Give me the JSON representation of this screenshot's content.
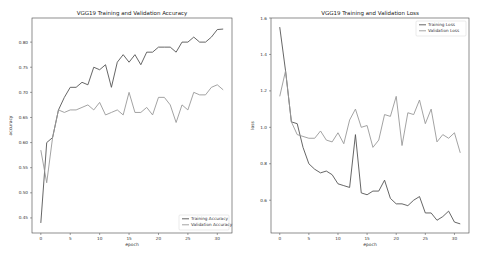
{
  "chart_data": [
    {
      "type": "line",
      "title": "VGG19 Training and Validation Accuracy",
      "xlabel": "epoch",
      "ylabel": "accuracy",
      "x": [
        0,
        1,
        2,
        3,
        4,
        5,
        6,
        7,
        8,
        9,
        10,
        11,
        12,
        13,
        14,
        15,
        16,
        17,
        18,
        19,
        20,
        21,
        22,
        23,
        24,
        25,
        26,
        27,
        28,
        29,
        30,
        31
      ],
      "xticks": [
        0,
        5,
        10,
        15,
        20,
        25,
        30
      ],
      "yticks": [
        0.45,
        0.5,
        0.55,
        0.6,
        0.65,
        0.7,
        0.75,
        0.8
      ],
      "ytick_labels": [
        "0.45",
        "0.50",
        "0.55",
        "0.60",
        "0.65",
        "0.70",
        "0.75",
        "0.80"
      ],
      "xlim": [
        -1.5,
        32.5
      ],
      "ylim": [
        0.42,
        0.848
      ],
      "grid": false,
      "legend_position": "lower right",
      "series": [
        {
          "name": "Training Accuracy",
          "color": "#555555",
          "values": [
            0.44,
            0.6,
            0.61,
            0.665,
            0.69,
            0.71,
            0.71,
            0.72,
            0.715,
            0.75,
            0.745,
            0.755,
            0.71,
            0.76,
            0.775,
            0.76,
            0.775,
            0.755,
            0.78,
            0.78,
            0.79,
            0.79,
            0.79,
            0.78,
            0.8,
            0.8,
            0.81,
            0.8,
            0.8,
            0.81,
            0.825,
            0.826
          ]
        },
        {
          "name": "Validation Accuracy",
          "color": "#999999",
          "values": [
            0.585,
            0.52,
            0.61,
            0.665,
            0.66,
            0.665,
            0.665,
            0.67,
            0.675,
            0.665,
            0.68,
            0.655,
            0.66,
            0.665,
            0.655,
            0.7,
            0.66,
            0.66,
            0.67,
            0.655,
            0.69,
            0.69,
            0.675,
            0.64,
            0.675,
            0.665,
            0.7,
            0.695,
            0.695,
            0.71,
            0.715,
            0.705
          ]
        }
      ]
    },
    {
      "type": "line",
      "title": "VGG19 Training and Validation Loss",
      "xlabel": "epoch",
      "ylabel": "loss",
      "x": [
        0,
        1,
        2,
        3,
        4,
        5,
        6,
        7,
        8,
        9,
        10,
        11,
        12,
        13,
        14,
        15,
        16,
        17,
        18,
        19,
        20,
        21,
        22,
        23,
        24,
        25,
        26,
        27,
        28,
        29,
        30,
        31
      ],
      "xticks": [
        0,
        5,
        10,
        15,
        20,
        25,
        30
      ],
      "yticks": [
        0.6,
        0.8,
        1.0,
        1.2,
        1.4,
        1.6
      ],
      "ytick_labels": [
        "0.6",
        "0.8",
        "1.0",
        "1.2",
        "1.4",
        "1.6"
      ],
      "xlim": [
        -1.5,
        32.5
      ],
      "ylim": [
        0.42,
        1.6
      ],
      "grid": false,
      "legend_position": "upper right",
      "series": [
        {
          "name": "Training Loss",
          "color": "#555555",
          "values": [
            1.55,
            1.31,
            1.03,
            1.02,
            0.89,
            0.8,
            0.77,
            0.75,
            0.76,
            0.74,
            0.69,
            0.68,
            0.67,
            0.96,
            0.64,
            0.63,
            0.65,
            0.65,
            0.71,
            0.61,
            0.58,
            0.58,
            0.57,
            0.6,
            0.62,
            0.53,
            0.53,
            0.49,
            0.51,
            0.54,
            0.48,
            0.47
          ]
        },
        {
          "name": "Validation Loss",
          "color": "#999999",
          "values": [
            1.17,
            1.31,
            1.03,
            0.96,
            0.95,
            0.94,
            0.94,
            0.98,
            0.93,
            0.92,
            0.97,
            0.91,
            1.04,
            1.1,
            1.0,
            1.01,
            0.89,
            0.93,
            1.07,
            1.06,
            1.17,
            0.9,
            1.08,
            1.07,
            1.15,
            1.02,
            1.1,
            0.92,
            0.96,
            0.94,
            0.97,
            0.86
          ]
        }
      ]
    }
  ]
}
